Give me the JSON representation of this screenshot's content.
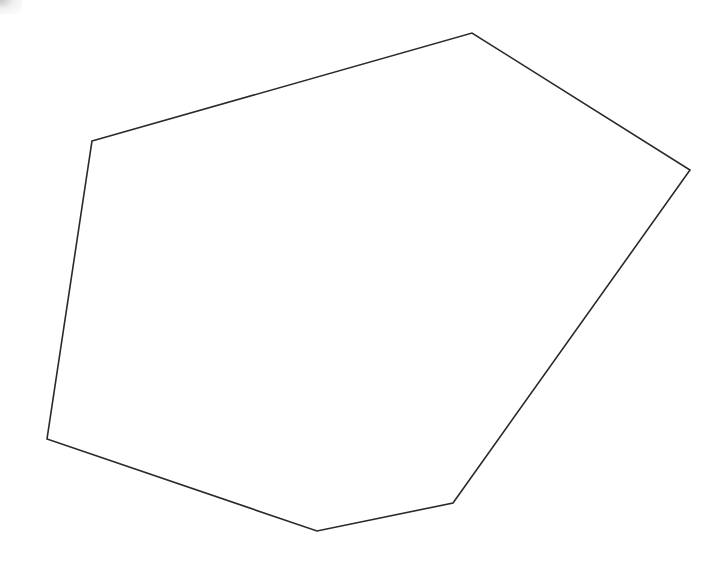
{
  "diagram": {
    "type": "polygon",
    "shape": "hexagon",
    "vertex_count": 6,
    "vertices": [
      {
        "x": 92,
        "y": 141
      },
      {
        "x": 472,
        "y": 33
      },
      {
        "x": 690,
        "y": 170
      },
      {
        "x": 453,
        "y": 503
      },
      {
        "x": 317,
        "y": 531
      },
      {
        "x": 47,
        "y": 439
      }
    ],
    "stroke_color": "#2a2a2a",
    "fill_color": "none",
    "background_color": "#ffffff",
    "stroke_width": 1.6
  }
}
